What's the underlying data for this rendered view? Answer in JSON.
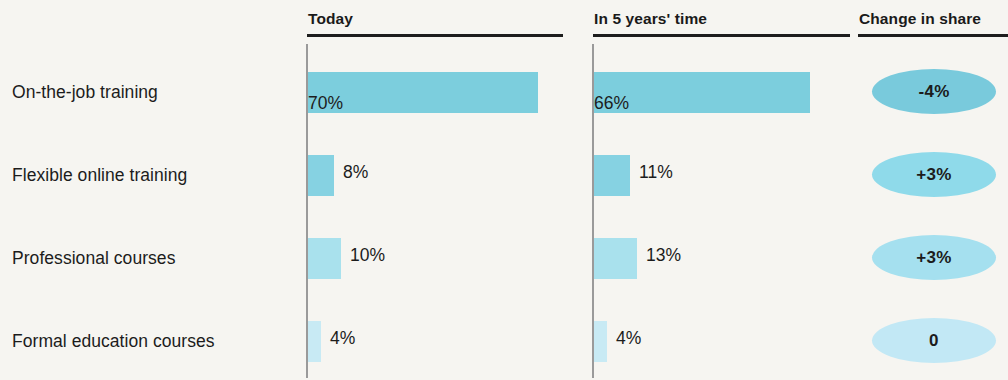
{
  "chart_data": {
    "type": "bar",
    "title": "",
    "xlabel": "",
    "ylabel": "",
    "grid": false,
    "legend": "none",
    "orientation": "horizontal",
    "categories": [
      "On-the-job training",
      "Flexible online training",
      "Professional courses",
      "Formal education courses"
    ],
    "series": [
      {
        "name": "Today",
        "values": [
          70,
          8,
          10,
          4
        ]
      },
      {
        "name": "In 5 years' time",
        "values": [
          66,
          11,
          13,
          4
        ]
      },
      {
        "name": "Change in share",
        "values": [
          -4,
          3,
          3,
          0
        ]
      }
    ],
    "xlim": [
      0,
      70
    ],
    "value_labels": {
      "today": [
        "70%",
        "8%",
        "10%",
        "4%"
      ],
      "future": [
        "66%",
        "11%",
        "13%",
        "4%"
      ],
      "change": [
        "-4%",
        "+3%",
        "+3%",
        "0"
      ]
    }
  },
  "headers": {
    "today": "Today",
    "future": "In 5 years' time",
    "change": "Change in share"
  },
  "rows": [
    {
      "label": "On-the-job training",
      "today_value": "70%",
      "today_pct": 70,
      "today_color": "#7cceddff",
      "future_value": "66%",
      "future_pct": 66,
      "future_color": "#7cceddff",
      "change_value": "-4%",
      "change_color": "#79cadc"
    },
    {
      "label": "Flexible online training",
      "today_value": "8%",
      "today_pct": 8,
      "today_color": "#86d2e2",
      "future_value": "11%",
      "future_pct": 11,
      "future_color": "#86d2e2",
      "change_value": "+3%",
      "change_color": "#8fdaea"
    },
    {
      "label": "Professional courses",
      "today_value": "10%",
      "today_pct": 10,
      "today_color": "#a9e1ed",
      "future_value": "13%",
      "future_pct": 13,
      "future_color": "#a9e1ed",
      "change_value": "+3%",
      "change_color": "#a5e0ef"
    },
    {
      "label": "Formal education courses",
      "today_value": "4%",
      "today_pct": 4,
      "today_color": "#c8eaf4",
      "future_value": "4%",
      "future_pct": 4,
      "future_color": "#c8eaf4",
      "change_value": "0",
      "change_color": "#c2e8f5"
    }
  ],
  "colors": {
    "background": "#f6f5f1",
    "text": "#1c1c1c",
    "rule": "#1d1d1d",
    "axis": "#9a9a9a"
  }
}
